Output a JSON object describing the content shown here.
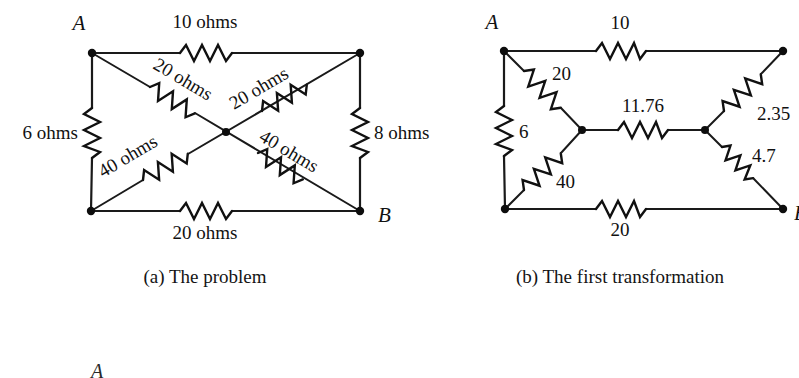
{
  "figure": {
    "background": "#ffffff",
    "ink": "#111111"
  },
  "panel_a": {
    "caption": "(a) The problem",
    "terminals": {
      "a": "A",
      "b": "B"
    },
    "resistors": {
      "top": "10 ohms",
      "left": "6 ohms",
      "right": "8 ohms",
      "bottom": "20 ohms",
      "diag_tl": "20 ohms",
      "diag_tr": "20 ohms",
      "diag_bl": "40 ohms",
      "diag_br": "40 ohms"
    }
  },
  "panel_b": {
    "caption": "(b) The first transformation",
    "terminals": {
      "a": "A",
      "b": "B"
    },
    "resistors": {
      "top": "10",
      "left": "6",
      "bottom": "20",
      "upper_left_arm": "20",
      "lower_left_arm": "40",
      "bridge": "11.76",
      "upper_right_arm": "2.35",
      "lower_right_arm": "4.7"
    }
  },
  "panel_c_partial": {
    "terminal_a": "A"
  }
}
